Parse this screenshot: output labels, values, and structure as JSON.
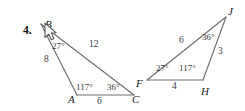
{
  "problem": {
    "number": "4."
  },
  "figure": {
    "stroke_color": "#6e6e72",
    "background_color": "#ffffff",
    "text_color": "#2b2b2e",
    "triangles": [
      {
        "name": "triangle-abc",
        "vertices": [
          {
            "label": "B",
            "x": 41,
            "y": 24
          },
          {
            "label": "A",
            "x": 77,
            "y": 95
          },
          {
            "label": "C",
            "x": 134,
            "y": 95
          }
        ],
        "angles": [
          {
            "at": "B",
            "value": "27°"
          },
          {
            "at": "A",
            "value": "117°"
          },
          {
            "at": "C",
            "value": "36°"
          }
        ],
        "sides": [
          {
            "between": "B-A",
            "value": "8"
          },
          {
            "between": "B-C",
            "value": "12"
          },
          {
            "between": "A-C",
            "value": "6"
          }
        ]
      },
      {
        "name": "triangle-fhj",
        "vertices": [
          {
            "label": "F",
            "x": 147,
            "y": 80
          },
          {
            "label": "H",
            "x": 203,
            "y": 80
          },
          {
            "label": "J",
            "x": 226,
            "y": 17
          }
        ],
        "angles": [
          {
            "at": "F",
            "value": "27°"
          },
          {
            "at": "H",
            "value": "117°"
          },
          {
            "at": "J",
            "value": "36°"
          }
        ],
        "sides": [
          {
            "between": "F-J",
            "value": "6"
          },
          {
            "between": "F-H",
            "value": "4"
          },
          {
            "between": "H-J",
            "value": "3"
          }
        ]
      }
    ]
  },
  "labels": {
    "vertex_b": "B",
    "vertex_a": "A",
    "vertex_c": "C",
    "vertex_f": "F",
    "vertex_h": "H",
    "vertex_j": "J",
    "angle_b": "27°",
    "angle_a": "117°",
    "angle_c": "36°",
    "angle_f": "27°",
    "angle_h": "117°",
    "angle_j": "36°",
    "side_ba": "8",
    "side_bc": "12",
    "side_ac": "6",
    "side_fj": "6",
    "side_fh": "4",
    "side_hj": "3"
  }
}
